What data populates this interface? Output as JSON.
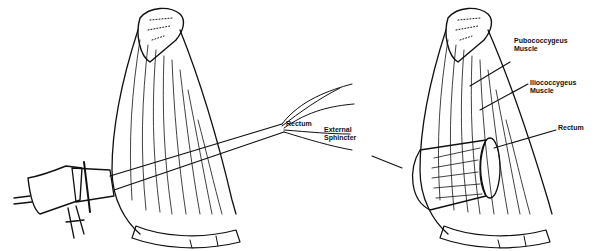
{
  "figure": {
    "left_panel": {
      "description": "Anoscope/proctoscope inserted through pelvic floor into rectum",
      "labels": [
        {
          "id": "rectum",
          "text": "Rectum"
        }
      ]
    },
    "right_panel": {
      "description": "Pelvic floor muscles around the rectum",
      "labels": [
        {
          "id": "pubococcygeus",
          "text": "Pubococcygeus\nMuscle"
        },
        {
          "id": "iliococcygeus",
          "text": "Iliococcygeus\nMuscle"
        },
        {
          "id": "rectum",
          "text": "Rectum"
        },
        {
          "id": "external_sphincter",
          "text": "External\nSphincter"
        }
      ]
    }
  }
}
